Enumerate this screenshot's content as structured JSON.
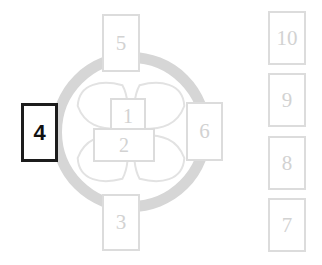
{
  "diagram": {
    "colors": {
      "ring_fill": "#d6d6d6",
      "petal_stroke": "#e2e2e2",
      "box_border": "#dcdcdc",
      "box_text": "#d2d2d2",
      "highlight_border": "#1c1c1c",
      "highlight_text": "#111111",
      "background": "#ffffff"
    },
    "ring": {
      "name": "outer-ring",
      "center_x": 131,
      "center_y": 132,
      "outer_radius": 80,
      "thickness": 11
    },
    "petals": [
      {
        "name": "petal-top-left",
        "position": "top-left"
      },
      {
        "name": "petal-top-right",
        "position": "top-right"
      },
      {
        "name": "petal-bottom-left",
        "position": "bottom-left"
      },
      {
        "name": "petal-bottom-right",
        "position": "bottom-right"
      }
    ],
    "boxes": [
      {
        "id": "box-1",
        "label": "1",
        "role": "center-upper",
        "highlighted": false,
        "x": 110,
        "y": 98,
        "w": 36,
        "h": 35
      },
      {
        "id": "box-2",
        "label": "2",
        "role": "center-lower",
        "highlighted": false,
        "x": 93,
        "y": 128,
        "w": 62,
        "h": 34
      },
      {
        "id": "box-3",
        "label": "3",
        "role": "bottom",
        "highlighted": false,
        "x": 102,
        "y": 194,
        "w": 38,
        "h": 57
      },
      {
        "id": "box-4",
        "label": "4",
        "role": "left",
        "highlighted": true,
        "x": 21,
        "y": 103,
        "w": 37,
        "h": 59
      },
      {
        "id": "box-5",
        "label": "5",
        "role": "top",
        "highlighted": false,
        "x": 102,
        "y": 14,
        "w": 38,
        "h": 58
      },
      {
        "id": "box-6",
        "label": "6",
        "role": "right",
        "highlighted": false,
        "x": 186,
        "y": 102,
        "w": 37,
        "h": 59
      }
    ],
    "column": {
      "name": "right-column",
      "boxes": [
        {
          "id": "box-10",
          "label": "10",
          "x": 268,
          "y": 11,
          "w": 38,
          "h": 54
        },
        {
          "id": "box-9",
          "label": "9",
          "x": 268,
          "y": 73,
          "w": 38,
          "h": 54
        },
        {
          "id": "box-8",
          "label": "8",
          "x": 268,
          "y": 136,
          "w": 38,
          "h": 54
        },
        {
          "id": "box-7",
          "label": "7",
          "x": 268,
          "y": 198,
          "w": 38,
          "h": 54
        }
      ]
    }
  }
}
